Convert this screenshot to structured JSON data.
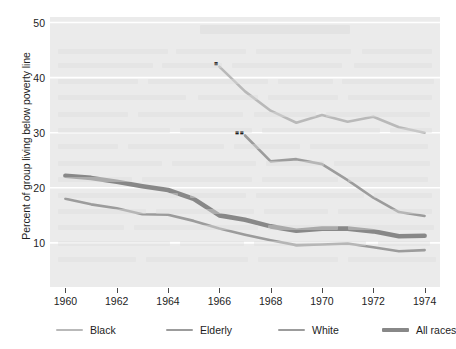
{
  "chart_data": {
    "type": "line",
    "title": "",
    "xlabel": "",
    "ylabel": "Percent of group living below poverty line",
    "xlim": [
      1959.4,
      1974.6
    ],
    "ylim": [
      2,
      51
    ],
    "grid": true,
    "gridlines_y": [
      10,
      20,
      30,
      40,
      50
    ],
    "legend_position": "bottom",
    "x_ticks": [
      1960,
      1962,
      1964,
      1966,
      1968,
      1970,
      1972,
      1974
    ],
    "x_tick_labels": [
      "1960",
      "1962",
      "1964",
      "1966",
      "1968",
      "1970",
      "1972",
      "1974"
    ],
    "y_ticks": [
      10,
      20,
      30,
      40,
      50
    ],
    "y_tick_labels": [
      "10",
      "20",
      "30",
      "40",
      "50"
    ],
    "series": [
      {
        "name": "Black",
        "color": "#b9b9b9",
        "width": 2.6,
        "marker_note": "*",
        "x": [
          1966,
          1967,
          1968,
          1969,
          1970,
          1971,
          1972,
          1973,
          1974
        ],
        "values": [
          42.0,
          37.5,
          34.0,
          31.8,
          33.2,
          32.0,
          32.9,
          31.0,
          30.0
        ]
      },
      {
        "name": "Elderly",
        "color": "#9c9c9c",
        "width": 2.6,
        "marker_note": "**",
        "x": [
          1967,
          1968,
          1969,
          1970,
          1971,
          1972,
          1973,
          1974
        ],
        "values": [
          29.5,
          24.8,
          25.2,
          24.3,
          21.4,
          18.2,
          15.6,
          14.9
        ]
      },
      {
        "name": "White",
        "color": "#9c9c9c",
        "width": 2.6,
        "marker_note": "",
        "x": [
          1960,
          1961,
          1962,
          1963,
          1964,
          1965,
          1966,
          1967,
          1968,
          1969,
          1970,
          1971,
          1972,
          1973,
          1974
        ],
        "values": [
          18.0,
          17.0,
          16.3,
          15.2,
          15.1,
          14.0,
          12.6,
          11.5,
          10.5,
          9.6,
          9.7,
          9.9,
          9.2,
          8.5,
          8.7
        ]
      },
      {
        "name": "All races",
        "color": "#888888",
        "width": 4.6,
        "marker_note": "",
        "x": [
          1960,
          1961,
          1962,
          1963,
          1964,
          1965,
          1966,
          1967,
          1968,
          1969,
          1970,
          1971,
          1972,
          1973,
          1974
        ],
        "values": [
          22.2,
          21.8,
          21.1,
          20.3,
          19.6,
          18.0,
          15.0,
          14.2,
          13.0,
          12.2,
          12.6,
          12.6,
          12.1,
          11.2,
          11.3
        ]
      }
    ]
  },
  "legend": {
    "items": [
      {
        "label": "Black",
        "color": "#b9b9b9",
        "thickness": "2.6px"
      },
      {
        "label": "Elderly",
        "color": "#9c9c9c",
        "thickness": "2.6px"
      },
      {
        "label": "White",
        "color": "#9c9c9c",
        "thickness": "2.6px"
      },
      {
        "label": "All races",
        "color": "#888888",
        "thickness": "4.6px"
      }
    ]
  },
  "annotations": {
    "black_marker": "*",
    "elderly_marker": "**"
  },
  "colors": {
    "plot_background": "#ebebeb",
    "gridline": "#ffffff",
    "text": "#1d1d1d",
    "page_background": "#ffffff"
  }
}
